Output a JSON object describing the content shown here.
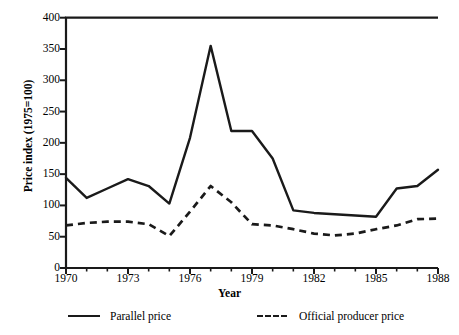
{
  "chart_data": {
    "type": "line",
    "title": "",
    "xlabel": "Year",
    "ylabel": "Price index (1975=100)",
    "xlim": [
      1970,
      1988
    ],
    "ylim": [
      0,
      400
    ],
    "ytick_labels": [
      "400",
      "350",
      "300",
      "250",
      "200",
      "150",
      "100",
      "50",
      "0"
    ],
    "yticks": [
      400,
      350,
      300,
      250,
      200,
      150,
      100,
      50,
      0
    ],
    "xtick_labels": [
      "1970",
      "1973",
      "1976",
      "1979",
      "1982",
      "1985",
      "1988"
    ],
    "xticks": [
      1970,
      1973,
      1976,
      1979,
      1982,
      1985,
      1988
    ],
    "grid": false,
    "legend_position": "below-axes",
    "x": [
      1970,
      1971,
      1972,
      1973,
      1974,
      1975,
      1976,
      1977,
      1978,
      1979,
      1980,
      1981,
      1982,
      1983,
      1984,
      1985,
      1986,
      1987,
      1988
    ],
    "series": [
      {
        "name": "Parallel price",
        "style": "solid",
        "color": "#1a1a1a",
        "values": [
          144,
          112,
          127,
          142,
          131,
          103,
          208,
          355,
          219,
          219,
          175,
          92,
          88,
          86,
          84,
          82,
          127,
          131,
          157
        ]
      },
      {
        "name": "Official producer price",
        "style": "dashed",
        "color": "#1a1a1a",
        "values": [
          68,
          72,
          74,
          74,
          70,
          51,
          90,
          131,
          105,
          70,
          68,
          62,
          55,
          52,
          55,
          62,
          68,
          78,
          79
        ]
      }
    ]
  },
  "legend": {
    "entries": [
      {
        "label": "Parallel price"
      },
      {
        "label": "Official producer price"
      }
    ]
  },
  "axes": {
    "ylabel": "Price index (1975=100)",
    "xlabel": "Year"
  }
}
